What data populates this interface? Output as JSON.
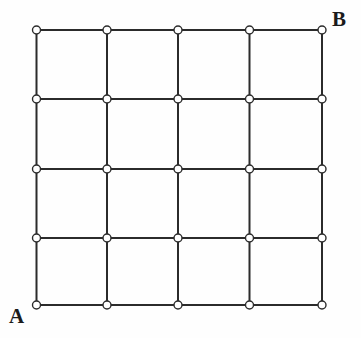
{
  "figure": {
    "name": "lattice-grid-path-diagram",
    "type": "diagram",
    "background_color": "#fefefe",
    "line_color": "#2b2b2b",
    "line_width": 2,
    "node_fill_color": "#ffffff",
    "node_stroke_color": "#2b2b2b",
    "node_stroke_width": 1.4,
    "node_radius": 4
  },
  "grid": {
    "columns": 4,
    "rows": 4,
    "node_columns": 5,
    "node_rows": 5,
    "total_nodes": 25,
    "x_positions": [
      36.5,
      107,
      178,
      249.5,
      322
    ],
    "y_positions": [
      30,
      99,
      169,
      238,
      305
    ],
    "cell_width": 71.4,
    "cell_height": 68.8
  },
  "labels": [
    {
      "id": "A",
      "text": "A",
      "node_column": 0,
      "node_row": 4,
      "position": "bottom-left",
      "x": 9,
      "y": 306
    },
    {
      "id": "B",
      "text": "B",
      "node_column": 4,
      "node_row": 0,
      "position": "top-right",
      "x": 332,
      "y": 9
    }
  ],
  "chart_data": {
    "type": "scatter",
    "title": "",
    "xlabel": "",
    "ylabel": "",
    "grid": true,
    "legend": "none",
    "xlim": [
      0,
      4
    ],
    "ylim": [
      0,
      4
    ],
    "x": [
      0,
      1,
      2,
      3,
      4,
      0,
      1,
      2,
      3,
      4,
      0,
      1,
      2,
      3,
      4,
      0,
      1,
      2,
      3,
      4,
      0,
      1,
      2,
      3,
      4
    ],
    "y": [
      4,
      4,
      4,
      4,
      4,
      3,
      3,
      3,
      3,
      3,
      2,
      2,
      2,
      2,
      2,
      1,
      1,
      1,
      1,
      1,
      0,
      0,
      0,
      0,
      0
    ],
    "annotations": [
      {
        "text": "A",
        "x": 0,
        "y": 0
      },
      {
        "text": "B",
        "x": 4,
        "y": 4
      }
    ]
  }
}
